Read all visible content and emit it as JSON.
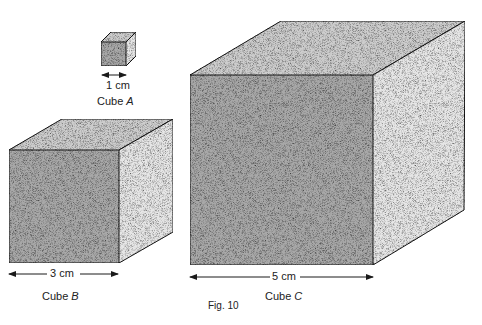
{
  "figure": {
    "caption": "Fig. 10"
  },
  "cubes": [
    {
      "id": "A",
      "name": "Cube",
      "letter": "A",
      "dimension": "1 cm"
    },
    {
      "id": "B",
      "name": "Cube",
      "letter": "B",
      "dimension": "3 cm"
    },
    {
      "id": "C",
      "name": "Cube",
      "letter": "C",
      "dimension": "5 cm"
    }
  ],
  "colors": {
    "front": "#a8a8a8",
    "top": "#cdcdcd",
    "side": "#e6e6e6",
    "edge": "#1a1a1a"
  }
}
